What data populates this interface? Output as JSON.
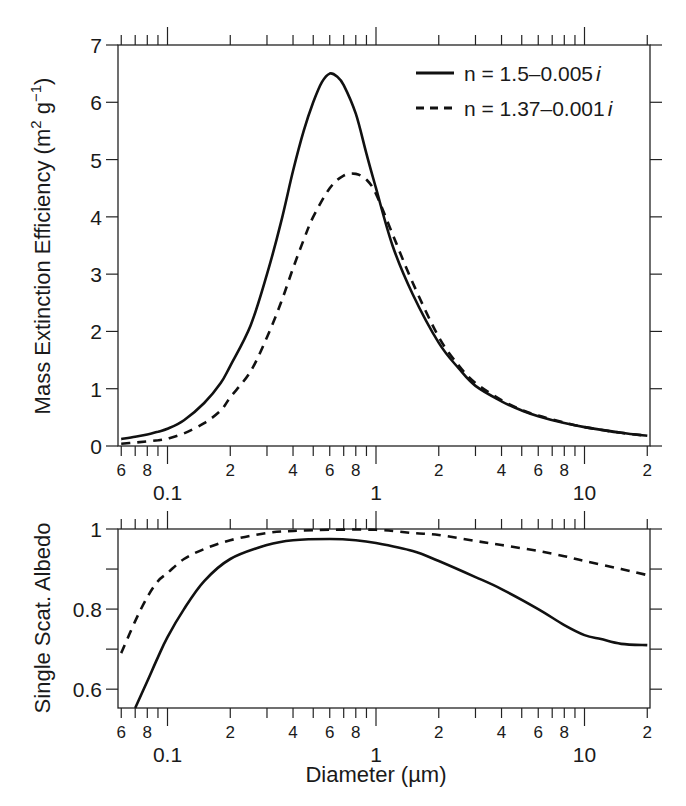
{
  "chart_data": [
    {
      "type": "line",
      "panel": "top",
      "title": "",
      "xlabel": "",
      "ylabel": "Mass Extinction Efficiency (m² g⁻¹)",
      "ylabel_parts": {
        "main": "Mass Extinction Efficiency (m",
        "sup1": "2",
        "mid": " g",
        "sup2": "−1",
        "end": ")"
      },
      "xscale": "log",
      "xlim": [
        0.06,
        20
      ],
      "ylim": [
        0,
        7
      ],
      "yticks": [
        0,
        1,
        2,
        3,
        4,
        5,
        6,
        7
      ],
      "xtick_major_labels": [
        "0.1",
        "1",
        "10"
      ],
      "xtick_minor_labels": [
        "6",
        "8",
        "2",
        "4",
        "6",
        "8",
        "2",
        "4",
        "6",
        "8",
        "2",
        "4",
        "6",
        "8",
        "2"
      ],
      "grid": false,
      "legend_position": "upper right",
      "series": [
        {
          "name": "n = 1.5–0.005i",
          "label_prefix": "n = 1.5–0.005",
          "style": "solid",
          "x": [
            0.06,
            0.07,
            0.08,
            0.09,
            0.1,
            0.12,
            0.15,
            0.18,
            0.2,
            0.25,
            0.3,
            0.35,
            0.4,
            0.45,
            0.5,
            0.55,
            0.6,
            0.65,
            0.7,
            0.8,
            0.9,
            1.0,
            1.2,
            1.5,
            2.0,
            2.5,
            3.0,
            4.0,
            5.0,
            6.0,
            8.0,
            10.0,
            15.0,
            20.0
          ],
          "y": [
            0.12,
            0.16,
            0.2,
            0.25,
            0.3,
            0.45,
            0.75,
            1.1,
            1.4,
            2.1,
            3.0,
            3.9,
            4.8,
            5.5,
            6.0,
            6.35,
            6.5,
            6.45,
            6.3,
            5.8,
            5.1,
            4.5,
            3.5,
            2.65,
            1.8,
            1.35,
            1.05,
            0.78,
            0.62,
            0.52,
            0.4,
            0.33,
            0.23,
            0.18
          ]
        },
        {
          "name": "n = 1.37–0.001i",
          "label_prefix": "n = 1.37–0.001",
          "style": "dashed",
          "x": [
            0.06,
            0.07,
            0.08,
            0.09,
            0.1,
            0.12,
            0.15,
            0.18,
            0.2,
            0.25,
            0.3,
            0.35,
            0.4,
            0.45,
            0.5,
            0.6,
            0.7,
            0.8,
            0.9,
            1.0,
            1.2,
            1.5,
            2.0,
            2.5,
            3.0,
            4.0,
            5.0,
            6.0,
            8.0,
            10.0,
            15.0,
            20.0
          ],
          "y": [
            0.04,
            0.06,
            0.08,
            0.1,
            0.13,
            0.22,
            0.4,
            0.62,
            0.85,
            1.3,
            1.9,
            2.5,
            3.1,
            3.6,
            4.0,
            4.5,
            4.72,
            4.75,
            4.65,
            4.4,
            3.7,
            2.85,
            1.9,
            1.4,
            1.1,
            0.8,
            0.63,
            0.53,
            0.41,
            0.33,
            0.23,
            0.18
          ]
        }
      ]
    },
    {
      "type": "line",
      "panel": "bottom",
      "title": "",
      "xlabel": "Diameter (µm)",
      "ylabel": "Single Scat. Albedo",
      "xscale": "log",
      "xlim": [
        0.06,
        20
      ],
      "ylim": [
        0.553,
        1.0
      ],
      "yticks": [
        0.6,
        0.7,
        0.8,
        0.9,
        1.0
      ],
      "ytick_labels": [
        "0.6",
        "",
        "0.8",
        "",
        "1"
      ],
      "xtick_major_labels": [
        "0.1",
        "1",
        "10"
      ],
      "xtick_minor_labels": [
        "6",
        "8",
        "2",
        "4",
        "6",
        "8",
        "2",
        "4",
        "6",
        "8",
        "2",
        "4",
        "6",
        "8",
        "2"
      ],
      "grid": false,
      "series": [
        {
          "name": "n = 1.5–0.005i",
          "style": "solid",
          "x": [
            0.07,
            0.08,
            0.09,
            0.1,
            0.12,
            0.15,
            0.2,
            0.3,
            0.4,
            0.6,
            0.8,
            1.0,
            1.5,
            2.0,
            3.0,
            4.0,
            6.0,
            8.0,
            10.0,
            12.0,
            15.0,
            20.0
          ],
          "y": [
            0.553,
            0.62,
            0.68,
            0.73,
            0.8,
            0.87,
            0.925,
            0.96,
            0.972,
            0.975,
            0.972,
            0.965,
            0.945,
            0.92,
            0.88,
            0.85,
            0.8,
            0.76,
            0.735,
            0.725,
            0.713,
            0.71
          ]
        },
        {
          "name": "n = 1.37–0.001i",
          "style": "dashed",
          "x": [
            0.06,
            0.07,
            0.08,
            0.09,
            0.1,
            0.12,
            0.15,
            0.2,
            0.3,
            0.4,
            0.6,
            1.0,
            1.5,
            2.0,
            3.0,
            4.0,
            6.0,
            8.0,
            10.0,
            15.0,
            20.0
          ],
          "y": [
            0.69,
            0.77,
            0.83,
            0.87,
            0.89,
            0.925,
            0.95,
            0.972,
            0.99,
            0.995,
            0.998,
            0.998,
            0.99,
            0.985,
            0.97,
            0.96,
            0.945,
            0.932,
            0.92,
            0.9,
            0.885
          ]
        }
      ]
    }
  ],
  "labels": {
    "top_ylabel": "Mass Extinction Efficiency (m",
    "top_ylabel_sup1": "2",
    "top_ylabel_mid": " g",
    "top_ylabel_sup2": "−1",
    "top_ylabel_end": ")",
    "bottom_ylabel": "Single Scat. Albedo",
    "xlabel": "Diameter (µm)",
    "legend_solid": "n = 1.5–0.005",
    "legend_dashed": "n = 1.37–0.001",
    "legend_italic": "i"
  }
}
